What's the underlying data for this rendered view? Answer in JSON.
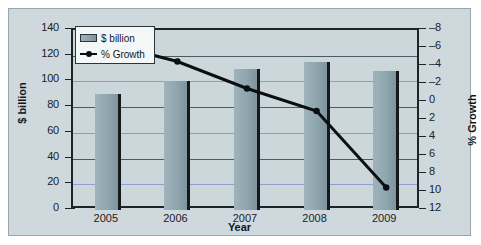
{
  "chart_data": {
    "type": "bar",
    "title": "",
    "xlabel": "Year",
    "ylabel": "$ billion",
    "y2label": "% Growth",
    "categories": [
      "2005",
      "2006",
      "2007",
      "2008",
      "2009"
    ],
    "ylim": [
      0,
      140
    ],
    "yticks": [
      0,
      20,
      40,
      60,
      80,
      100,
      120,
      140
    ],
    "y2lim": [
      -8,
      12
    ],
    "y2ticks": [
      -8,
      -6,
      -4,
      -2,
      0,
      2,
      4,
      6,
      8,
      10,
      12
    ],
    "grid": true,
    "legend_position": "upper-left",
    "series": [
      {
        "name": "$ billion",
        "type": "bar",
        "axis": "left",
        "color": "#8fa6af",
        "values": [
          90,
          100,
          110,
          115,
          108
        ]
      },
      {
        "name": "% Growth",
        "type": "line",
        "axis": "right",
        "color": "#0c0f11",
        "values": [
          10.5,
          8.5,
          5.5,
          3.0,
          -5.5
        ]
      }
    ]
  },
  "legend": {
    "items": [
      {
        "label": "$ billion",
        "marker": "bar-swatch"
      },
      {
        "label": "% Growth",
        "marker": "line-marker"
      }
    ]
  },
  "axes": {
    "left_title": "$ billion",
    "right_title": "% Growth",
    "x_title": "Year",
    "left_ticks": [
      "140",
      "120",
      "100",
      "80",
      "60",
      "40",
      "20",
      "0"
    ],
    "right_ticks": [
      "12",
      "10",
      "8",
      "6",
      "4",
      "2",
      "0",
      "–2",
      "–4",
      "–6",
      "–8"
    ],
    "x_ticks": [
      "2005",
      "2006",
      "2007",
      "2008",
      "2009"
    ]
  },
  "colors": {
    "background": "#cfd9dd",
    "plot_background": "#ccd7dc",
    "bar_fill": "#8fa6af",
    "line": "#0c0f11",
    "axis": "#1d2326",
    "gridline": "#4c5a61"
  }
}
